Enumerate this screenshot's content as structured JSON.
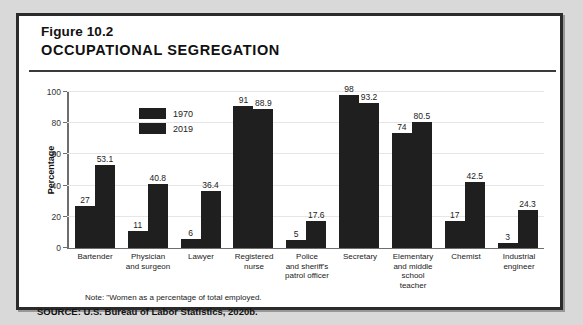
{
  "figure": {
    "number": "Figure 10.2",
    "title": "OCCUPATIONAL SEGREGATION",
    "note": "Note: \"Women as a percentage of total employed.",
    "source": "SOURCE: U.S. Bureau of Labor Statistics, 2020b."
  },
  "colors": {
    "bar": "#1f1f1f",
    "frame": "#2b2b2b",
    "grid": "#e6e6e6",
    "axis": "#6e6e6e",
    "background": "#ffffff",
    "page": "#d9d9d9"
  },
  "chart_data": {
    "type": "bar",
    "title": "OCCUPATIONAL SEGREGATION",
    "xlabel": "",
    "ylabel": "Percentage",
    "ylim": [
      0,
      100
    ],
    "yticks": [
      0,
      20,
      40,
      60,
      80,
      100
    ],
    "grid": true,
    "legend_position": "inside-top-left",
    "categories": [
      "Bartender",
      "Physician and surgeon",
      "Lawyer",
      "Registered nurse",
      "Police and sheriff's patrol officer",
      "Secretary",
      "Elementary and middle school teacher",
      "Chemist",
      "Industrial engineer"
    ],
    "category_lines": [
      [
        "Bartender"
      ],
      [
        "Physician",
        "and surgeon"
      ],
      [
        "Lawyer"
      ],
      [
        "Registered",
        "nurse"
      ],
      [
        "Police",
        "and sheriff's",
        "patrol officer"
      ],
      [
        "Secretary"
      ],
      [
        "Elementary",
        "and middle",
        "school teacher"
      ],
      [
        "Chemist"
      ],
      [
        "Industrial",
        "engineer"
      ]
    ],
    "series": [
      {
        "name": "1970",
        "values": [
          27,
          11,
          6,
          91,
          5,
          98,
          74,
          17,
          3
        ],
        "labels": [
          "27",
          "11",
          "6",
          "91",
          "5",
          "98",
          "74",
          "17",
          "3"
        ]
      },
      {
        "name": "2019",
        "values": [
          53.1,
          40.8,
          36.4,
          88.9,
          17.6,
          93.2,
          80.5,
          42.5,
          24.3
        ],
        "labels": [
          "53.1",
          "40.8",
          "36.4",
          "88.9",
          "17.6",
          "93.2",
          "80.5",
          "42.5",
          "24.3"
        ]
      }
    ]
  }
}
